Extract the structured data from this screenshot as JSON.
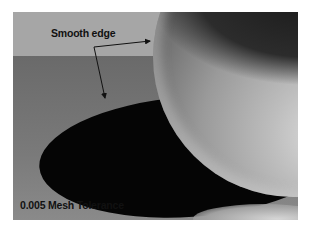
{
  "image": {
    "description": "3D render of a glossy sphere casting a dark elliptical shadow on a grey floor",
    "annotations": {
      "smooth_edge_label": "Smooth edge",
      "mesh_tolerance_label": "0.005 Mesh Tolerance"
    },
    "colors": {
      "wall": "#a6a6a6",
      "floor": "#737373",
      "shadow": "#050505",
      "sphere_highlight": "#dcdcdc",
      "text": "#111111"
    }
  }
}
